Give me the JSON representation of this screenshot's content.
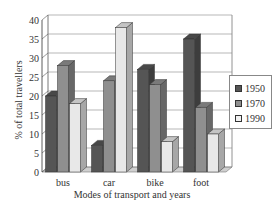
{
  "chart_data": {
    "type": "bar",
    "style": "3d-clustered-column",
    "title": "",
    "xlabel": "Modes of transport and years",
    "ylabel": "% of total travellers",
    "categories": [
      "bus",
      "car",
      "bike",
      "foot"
    ],
    "series": [
      {
        "name": "1950",
        "values": [
          20,
          7,
          27,
          35
        ],
        "color": "#555555"
      },
      {
        "name": "1970",
        "values": [
          28,
          24,
          23,
          17
        ],
        "color": "#8f8f8f"
      },
      {
        "name": "1990",
        "values": [
          18,
          38,
          8,
          10
        ],
        "color": "#e8e8e8"
      }
    ],
    "ylim": [
      0,
      40
    ],
    "yticks": [
      "0",
      "5",
      "10",
      "15",
      "20",
      "25",
      "30",
      "35",
      "40"
    ],
    "grid": true,
    "legend_position": "right"
  }
}
